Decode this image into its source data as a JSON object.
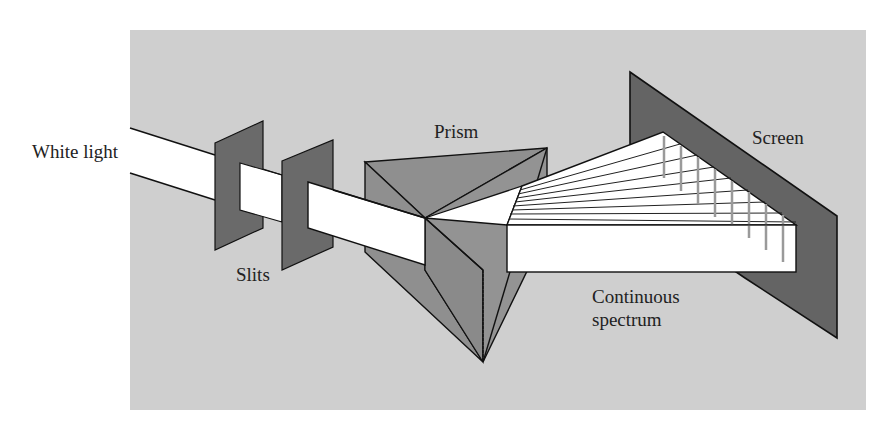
{
  "diagram": {
    "colors": {
      "background_panel": "#cfcfcf",
      "slit": "#6a6a6a",
      "prism_face": "#8f8f8f",
      "prism_face_light": "#9a9a9a",
      "screen": "#646464",
      "beam": "#ffffff",
      "outline": "#111111",
      "spectrum_tick": "#9a9a9a"
    },
    "labels": {
      "white_light": "White light",
      "slits": "Slits",
      "prism": "Prism",
      "screen": "Screen",
      "spectrum_line1": "Continuous",
      "spectrum_line2": "spectrum"
    },
    "components": [
      {
        "name": "White light",
        "type": "incident beam"
      },
      {
        "name": "Slits",
        "type": "two collimating slits"
      },
      {
        "name": "Prism",
        "type": "triangular prism"
      },
      {
        "name": "Screen",
        "type": "projection screen"
      },
      {
        "name": "Continuous spectrum",
        "type": "dispersed band"
      }
    ],
    "spectrum_rays": 9
  }
}
